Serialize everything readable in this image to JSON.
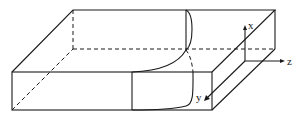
{
  "figure": {
    "axes": {
      "x_label": "x",
      "y_label": "y",
      "z_label": "z"
    },
    "colors": {
      "stroke": "#1a1a1a",
      "background": "#ffffff"
    }
  }
}
